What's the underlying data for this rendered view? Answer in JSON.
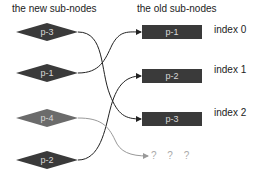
{
  "headers": {
    "new": "the new sub-nodes",
    "old": "the old sub-nodes"
  },
  "new_nodes": [
    {
      "label": "p-3",
      "cy": 32,
      "color": "#3a3a3a"
    },
    {
      "label": "p-1",
      "cy": 73,
      "color": "#3a3a3a"
    },
    {
      "label": "p-4",
      "cy": 118,
      "color": "#6b6b6b"
    },
    {
      "label": "p-2",
      "cy": 160,
      "color": "#3a3a3a"
    }
  ],
  "old_nodes": [
    {
      "label": "p-1",
      "index": "index 0"
    },
    {
      "label": "p-2",
      "index": "index 1"
    },
    {
      "label": "p-3",
      "index": "index 2"
    }
  ],
  "unknown_target": "? ? ?",
  "colors": {
    "dark": "#3a3a3a",
    "light": "#6b6b6b",
    "edge": "#222222",
    "edge_light": "#999999"
  }
}
